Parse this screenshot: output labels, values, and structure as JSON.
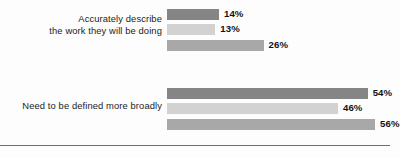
{
  "chart_data": {
    "type": "bar",
    "orientation": "horizontal",
    "title": "",
    "xlabel": "",
    "ylabel": "",
    "xlim": [
      0,
      60
    ],
    "grid": false,
    "legend": "none",
    "value_format": "percent",
    "categories": [
      "Accurately describe the work they will be doing",
      "Need to be defined more broadly"
    ],
    "series": [
      {
        "name": "Series 1",
        "color": "#858585",
        "values": [
          14,
          46
        ]
      },
      {
        "name": "Series 2",
        "color": "#d2d2d2",
        "values": [
          13,
          46
        ]
      },
      {
        "name": "Series 3",
        "color": "#a8a8a8",
        "values": [
          26,
          56
        ]
      }
    ],
    "groups": [
      {
        "label_lines": [
          "Accurately describe",
          "the work they will be doing"
        ],
        "bars": [
          {
            "value_label": "14%",
            "value": 14,
            "color": "#858585"
          },
          {
            "value_label": "13%",
            "value": 13,
            "color": "#d2d2d2"
          },
          {
            "value_label": "26%",
            "value": 26,
            "color": "#a8a8a8"
          }
        ]
      },
      {
        "label_lines": [
          "Need to be defined more broadly"
        ],
        "bars": [
          {
            "value_label": "54%",
            "value": 54,
            "color": "#858585"
          },
          {
            "value_label": "46%",
            "value": 46,
            "color": "#d2d2d2"
          },
          {
            "value_label": "56%",
            "value": 56,
            "color": "#a8a8a8"
          }
        ]
      }
    ]
  },
  "style": {
    "background": "#fdfdfd",
    "text_color": "#1c1c1c",
    "value_color": "#121212",
    "baseline_color": "#6f6f6f"
  }
}
